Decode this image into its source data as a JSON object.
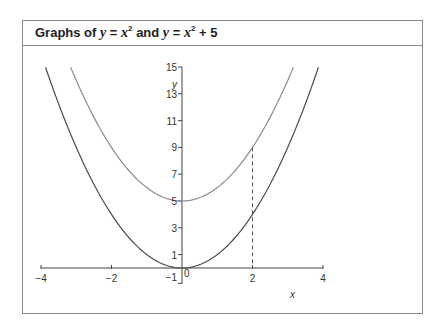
{
  "title": {
    "prefix": "Graphs of ",
    "eq1_lhs": "y",
    "eq1_rhs_var": "x",
    "eq1_exp": "2",
    "joiner": " and ",
    "eq2_lhs": "y",
    "eq2_rhs_var": "x",
    "eq2_exp": "2",
    "eq2_suffix": " + 5",
    "full": "Graphs of y = x² and y = x² + 5"
  },
  "colors": {
    "frame": "#8a8a8a",
    "axis": "#444444",
    "curve_base": "#4a4a4a",
    "curve_shifted": "#8c8c8c",
    "dashed": "#555555"
  },
  "chart_data": {
    "type": "line",
    "xlabel": "x",
    "ylabel": "y",
    "xlim": [
      -4,
      4
    ],
    "ylim": [
      -1,
      15
    ],
    "x_ticks": [
      -4,
      -2,
      -1,
      0,
      2,
      4
    ],
    "x_tick_labels": [
      "−4",
      "−2",
      "−1",
      "0",
      "2",
      "4"
    ],
    "y_ticks": [
      1,
      3,
      5,
      7,
      9,
      11,
      13,
      15
    ],
    "y_tick_labels": [
      "1",
      "3",
      "5",
      "7",
      "9",
      "11",
      "13",
      "15"
    ],
    "grid": false,
    "legend": null,
    "series": [
      {
        "name": "y = x²",
        "formula": "x^2",
        "x_range": [
          -3.87,
          3.87
        ],
        "x": [
          -3.87,
          -3,
          -2,
          -1,
          0,
          1,
          2,
          3,
          3.87
        ],
        "values": [
          15,
          9,
          4,
          1,
          0,
          1,
          4,
          9,
          15
        ],
        "color": "#4a4a4a"
      },
      {
        "name": "y = x² + 5",
        "formula": "x^2 + 5",
        "x_range": [
          -3.16,
          3.16
        ],
        "x": [
          -3.16,
          -3,
          -2,
          -1,
          0,
          1,
          2,
          3,
          3.16
        ],
        "values": [
          15,
          14,
          9,
          6,
          5,
          6,
          9,
          14,
          15
        ],
        "color": "#8c8c8c"
      }
    ],
    "annotations": [
      {
        "type": "dashed-vertical",
        "x": 2,
        "y_from": 0,
        "y_to": 9,
        "note": "vertical gap of 5 between curves at x = 2"
      }
    ]
  }
}
